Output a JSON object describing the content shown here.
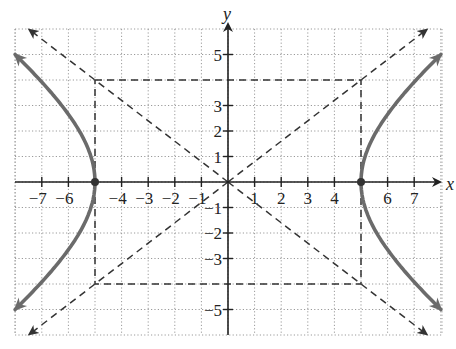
{
  "chart_data": {
    "type": "line",
    "title": "",
    "xlabel": "x",
    "ylabel": "y",
    "xlim": [
      -8,
      8
    ],
    "ylim": [
      -6,
      6
    ],
    "grid": true,
    "x_tick_labels": [
      "-7",
      "-6",
      "-4",
      "-3",
      "-2",
      "-1",
      "1",
      "2",
      "3",
      "4",
      "6",
      "7"
    ],
    "y_tick_labels": [
      "5",
      "3",
      "2",
      "1",
      "-1",
      "-2",
      "-3",
      "-5"
    ],
    "x_ticks": [
      -7,
      -6,
      -4,
      -3,
      -2,
      -1,
      1,
      2,
      3,
      4,
      6,
      7
    ],
    "y_ticks": [
      5,
      3,
      2,
      1,
      -1,
      -2,
      -3,
      -5
    ],
    "equation": "x^2/25 - y^2/16 = 1",
    "vertices": [
      [
        -5,
        0
      ],
      [
        5,
        0
      ]
    ],
    "series": [
      {
        "name": "hyperbola-right-branch",
        "style": "solid-thick",
        "color": "#6b6b6b",
        "points": [
          [
            8.0,
            5
          ],
          [
            7.07,
            4
          ],
          [
            6.25,
            3
          ],
          [
            5.59,
            2
          ],
          [
            5.15,
            1
          ],
          [
            5,
            0
          ],
          [
            5.15,
            -1
          ],
          [
            5.59,
            -2
          ],
          [
            6.25,
            -3
          ],
          [
            7.07,
            -4
          ],
          [
            8.0,
            -5
          ]
        ]
      },
      {
        "name": "hyperbola-left-branch",
        "style": "solid-thick",
        "color": "#6b6b6b",
        "points": [
          [
            -8.0,
            5
          ],
          [
            -7.07,
            4
          ],
          [
            -6.25,
            3
          ],
          [
            -5.59,
            2
          ],
          [
            -5.15,
            1
          ],
          [
            -5,
            0
          ],
          [
            -5.15,
            -1
          ],
          [
            -5.59,
            -2
          ],
          [
            -6.25,
            -3
          ],
          [
            -7.07,
            -4
          ],
          [
            -8.0,
            -5
          ]
        ]
      },
      {
        "name": "asymptote-positive",
        "style": "dashed",
        "equation": "y = 4/5 x",
        "points": [
          [
            -7.5,
            -6
          ],
          [
            7.5,
            6
          ]
        ]
      },
      {
        "name": "asymptote-negative",
        "style": "dashed",
        "equation": "y = -4/5 x",
        "points": [
          [
            -7.5,
            6
          ],
          [
            7.5,
            -6
          ]
        ]
      },
      {
        "name": "fundamental-rectangle",
        "style": "dashed",
        "points": [
          [
            -5,
            4
          ],
          [
            5,
            4
          ],
          [
            5,
            -4
          ],
          [
            -5,
            -4
          ],
          [
            -5,
            4
          ]
        ]
      }
    ]
  },
  "labels": {
    "x_axis": "x",
    "y_axis": "y"
  }
}
